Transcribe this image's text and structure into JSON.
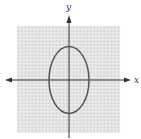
{
  "chart_data": {
    "type": "line",
    "title": "",
    "xlabel": "x",
    "ylabel": "y",
    "grid": true,
    "xlim": [
      -15,
      15
    ],
    "ylim": [
      -15,
      15
    ],
    "series": [
      {
        "name": "ellipse",
        "shape": "ellipse",
        "center": [
          0,
          0
        ],
        "semi_axis_x": 6,
        "semi_axis_y": 10,
        "color": "#555555"
      }
    ],
    "tick_labels": []
  },
  "colors": {
    "grid_bg": "#d9d9d9",
    "grid_line": "#f2f2f2",
    "axis": "#333333",
    "curve": "#555555"
  },
  "labels": {
    "x": "x",
    "y": "y"
  }
}
